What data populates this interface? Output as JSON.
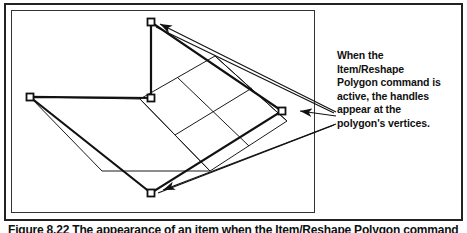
{
  "figure": {
    "annotation": {
      "lines": [
        "When the",
        "Item/Reshape",
        "Polygon command is",
        "active, the handles",
        "appear at the",
        "polygon's vertices."
      ],
      "full_text": "When the Item/Reshape Polygon command is active, the handles appear at the polygon's vertices."
    },
    "caption": {
      "number": "Figure 8.22",
      "text": "The appearance of an item when the Item/Reshape Polygon command",
      "full": "Figure 8.22 The appearance of an item when the Item/Reshape Polygon command"
    },
    "canvas": {
      "shape_name": "reshape-polygon",
      "handle_count": 5,
      "handles": [
        {
          "name": "vertex-handle-top",
          "x": 150,
          "y": 21
        },
        {
          "name": "vertex-handle-left",
          "x": 29,
          "y": 96
        },
        {
          "name": "vertex-handle-middle",
          "x": 150,
          "y": 97
        },
        {
          "name": "vertex-handle-right",
          "x": 281,
          "y": 110
        },
        {
          "name": "vertex-handle-bottom",
          "x": 150,
          "y": 192
        }
      ],
      "arrow_targets": [
        {
          "name": "arrow-to-top-vertex",
          "x": 150,
          "y": 21
        },
        {
          "name": "arrow-to-right-vertex",
          "x": 281,
          "y": 110
        },
        {
          "name": "arrow-to-bottom-vertex",
          "x": 150,
          "y": 192
        }
      ]
    },
    "colors": {
      "ink": "#111111",
      "frame": "#222222",
      "canvas_border": "#333333",
      "background": "#ffffff"
    }
  }
}
